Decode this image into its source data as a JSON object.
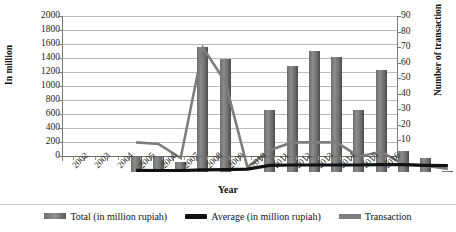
{
  "chart_data": {
    "type": "bar",
    "title": "",
    "xlabel": "Year",
    "ylabel": "In million",
    "ylabel_secondary": "Number of transaction",
    "grid": true,
    "legend_position": "bottom",
    "ylim": [
      0,
      2000
    ],
    "ylim_secondary": [
      0,
      90
    ],
    "ytick_step": 200,
    "ytick_secondary_step": 10,
    "yticks": [
      "2000",
      "1800",
      "1600",
      "1400",
      "1200",
      "1000",
      "800",
      "600",
      "400",
      "200",
      "0"
    ],
    "yticks_secondary": [
      "90",
      "80",
      "70",
      "60",
      "50",
      "40",
      "30",
      "20",
      "10",
      "0"
    ],
    "categories": [
      "2002",
      "2003",
      "2004",
      "2005",
      "2006",
      "2007",
      "2008",
      "2009",
      "2010",
      "2011",
      "2012",
      "2013",
      "2014",
      "2015",
      "2016"
    ],
    "series": [
      {
        "name": "Total  (in million rupiah)",
        "type": "bar",
        "axis": "left",
        "color": "#7a7a7a",
        "values": [
          230,
          215,
          140,
          1790,
          1615,
          0,
          885,
          1515,
          1735,
          1640,
          890,
          1455,
          300,
          200,
          20
        ]
      },
      {
        "name": "Average (in million rupiah)",
        "type": "line",
        "axis": "left",
        "color": "#111111",
        "values": [
          25,
          22,
          20,
          30,
          35,
          40,
          95,
          100,
          100,
          100,
          100,
          105,
          105,
          95,
          90
        ]
      },
      {
        "name": "Transaction",
        "type": "line",
        "axis": "right",
        "color": "#7d7d7d",
        "values": [
          19,
          18,
          9,
          80,
          58,
          3,
          14,
          19,
          19,
          19,
          10,
          13,
          5,
          4,
          2
        ]
      }
    ]
  },
  "legend": {
    "items": [
      {
        "label": "Total  (in million rupiah)",
        "marker": "bar-swatch"
      },
      {
        "label": "Average (in million rupiah)",
        "marker": "line-swatch-black"
      },
      {
        "label": "Transaction",
        "marker": "line-swatch-gray"
      }
    ]
  }
}
